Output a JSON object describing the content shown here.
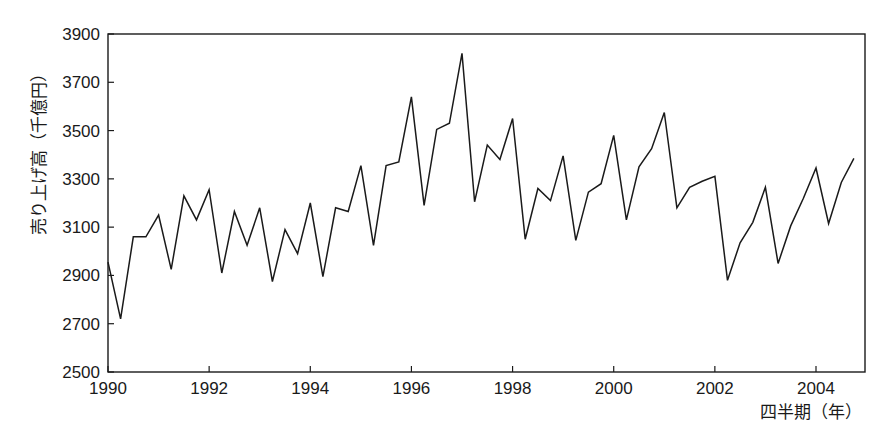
{
  "chart_data": {
    "type": "line",
    "title": "",
    "xlabel": "四半期（年）",
    "ylabel": "売り上げ高（千億円）",
    "xlim": [
      1990,
      2004.85
    ],
    "ylim": [
      2500,
      3900
    ],
    "yticks": [
      2500,
      2700,
      2900,
      3100,
      3300,
      3500,
      3700,
      3900
    ],
    "xticks": [
      1990,
      1992,
      1994,
      1996,
      1998,
      2000,
      2002,
      2004
    ],
    "grid": false,
    "legend": null,
    "series": [
      {
        "name": "売り上げ高",
        "color": "#1a1a1a",
        "x": [
          1990.0,
          1990.25,
          1990.5,
          1990.75,
          1991.0,
          1991.25,
          1991.5,
          1991.75,
          1992.0,
          1992.25,
          1992.5,
          1992.75,
          1993.0,
          1993.25,
          1993.5,
          1993.75,
          1994.0,
          1994.25,
          1994.5,
          1994.75,
          1995.0,
          1995.25,
          1995.5,
          1995.75,
          1996.0,
          1996.25,
          1996.5,
          1996.75,
          1997.0,
          1997.25,
          1997.5,
          1997.75,
          1998.0,
          1998.25,
          1998.5,
          1998.75,
          1999.0,
          1999.25,
          1999.5,
          1999.75,
          2000.0,
          2000.25,
          2000.5,
          2000.75,
          2001.0,
          2001.25,
          2001.5,
          2001.75,
          2002.0,
          2002.25,
          2002.5,
          2002.75,
          2003.0,
          2003.25,
          2003.5,
          2003.75,
          2004.0,
          2004.25,
          2004.5,
          2004.75
        ],
        "values": [
          2955,
          2720,
          3060,
          3060,
          3150,
          2925,
          3230,
          3130,
          3255,
          2910,
          3165,
          3025,
          3180,
          2875,
          3090,
          2990,
          3200,
          2895,
          3180,
          3165,
          3355,
          3025,
          3355,
          3370,
          3640,
          3190,
          3505,
          3530,
          3820,
          3205,
          3440,
          3380,
          3550,
          3050,
          3260,
          3210,
          3395,
          3045,
          3245,
          3280,
          3480,
          3130,
          3350,
          3425,
          3575,
          3180,
          3265,
          3290,
          3310,
          2880,
          3035,
          3120,
          3265,
          2950,
          3105,
          3220,
          3345,
          3115,
          3285,
          3385
        ]
      }
    ]
  },
  "axes": {
    "x_title": "四半期（年）",
    "y_title": "売り上げ高（千億円）"
  }
}
